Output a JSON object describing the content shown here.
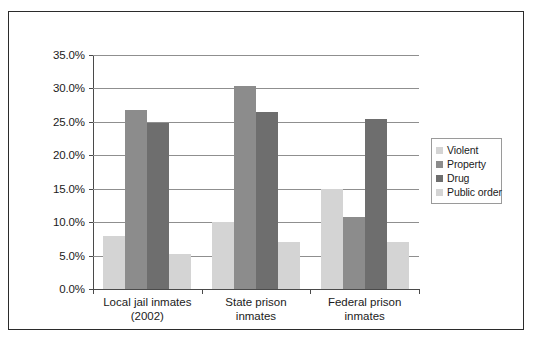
{
  "chart_data": {
    "type": "bar",
    "title": "",
    "xlabel": "",
    "ylabel": "",
    "ylim": [
      0,
      35
    ],
    "ytick_labels": [
      "35.0%",
      "30.0%",
      "25.0%",
      "20.0%",
      "15.0%",
      "10.0%",
      "5.0%",
      "0.0%"
    ],
    "ytick_values": [
      35,
      30,
      25,
      20,
      15,
      10,
      5,
      0
    ],
    "grid": true,
    "legend_position": "right",
    "categories": [
      "Local jail inmates (2002)",
      "State prison inmates",
      "Federal prison inmates"
    ],
    "category_lines": [
      [
        "Local jail inmates",
        "(2002)"
      ],
      [
        "State prison",
        "inmates"
      ],
      [
        "Federal prison",
        "inmates"
      ]
    ],
    "series": [
      {
        "name": "Violent",
        "color": "#d4d4d4",
        "values": [
          8.0,
          10.0,
          15.0
        ]
      },
      {
        "name": "Property",
        "color": "#8c8c8c",
        "values": [
          26.8,
          30.3,
          10.7
        ]
      },
      {
        "name": "Drug",
        "color": "#6e6e6e",
        "values": [
          24.9,
          26.5,
          25.4
        ]
      },
      {
        "name": "Public order",
        "color": "#d4d4d4",
        "values": [
          5.2,
          7.0,
          7.0
        ]
      }
    ]
  },
  "legend": {
    "items": [
      {
        "label": "Violent"
      },
      {
        "label": "Property"
      },
      {
        "label": "Drug"
      },
      {
        "label": "Public order"
      }
    ]
  }
}
